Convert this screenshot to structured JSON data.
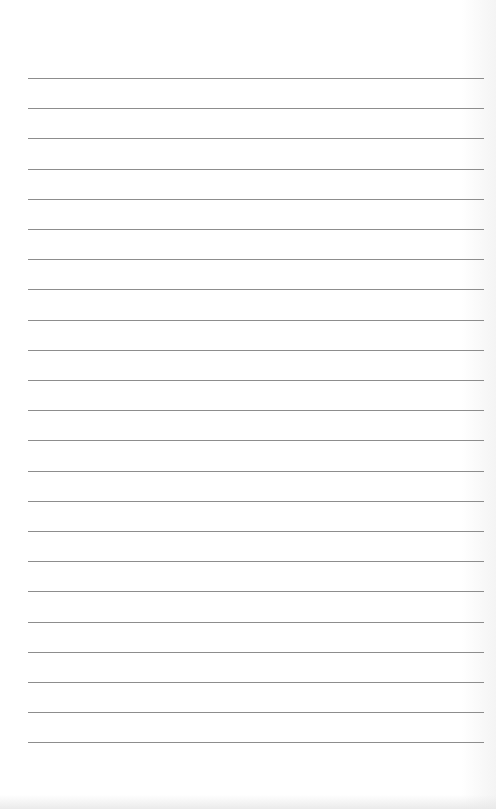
{
  "page": {
    "type": "lined-paper",
    "background_color": "#ffffff",
    "line_color": "#8d8d8d",
    "line_count": 23,
    "first_line_y": 78,
    "line_spacing": 30.2,
    "line_left": 28,
    "line_right": 484
  }
}
